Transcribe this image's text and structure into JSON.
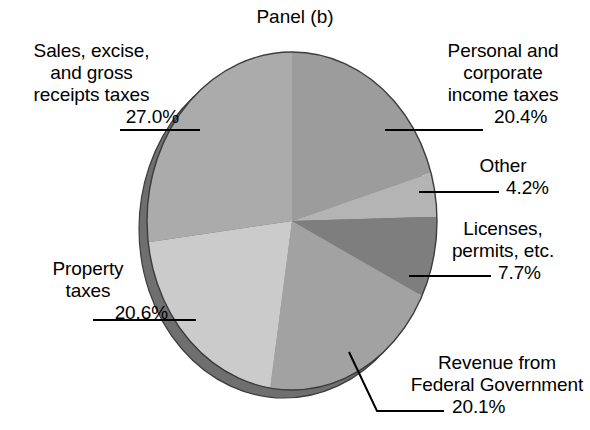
{
  "title": "Panel (b)",
  "chart_data": {
    "type": "pie",
    "title": "Panel (b)",
    "xlabel": "",
    "ylabel": "",
    "grid": false,
    "legend": "none",
    "labels_position": "outside-with-leader-lines",
    "style": "3d-ellipse",
    "total": "100.0%",
    "slices": [
      {
        "name": "personal-and-corporate-income-taxes",
        "label_lines": [
          "Personal and",
          "corporate",
          "income taxes"
        ],
        "value_text": "20.4%",
        "value": 20.4,
        "color": "#9c9c9c",
        "start_angle_deg": 0,
        "end_angle_deg": 73.44
      },
      {
        "name": "other",
        "label_lines": [
          "Other"
        ],
        "value_text": "4.2%",
        "value": 4.2,
        "color": "#b4b4b4",
        "start_angle_deg": 73.44,
        "end_angle_deg": 88.56
      },
      {
        "name": "licenses-permits-etc",
        "label_lines": [
          "Licenses,",
          "permits, etc."
        ],
        "value_text": "7.7%",
        "value": 7.7,
        "color": "#7e7e7e",
        "start_angle_deg": 88.56,
        "end_angle_deg": 116.28
      },
      {
        "name": "revenue-from-federal-government",
        "label_lines": [
          "Revenue from",
          "Federal Government"
        ],
        "value_text": "20.1%",
        "value": 20.1,
        "color": "#a2a2a2",
        "start_angle_deg": 116.28,
        "end_angle_deg": 188.64
      },
      {
        "name": "property-taxes",
        "label_lines": [
          "Property",
          "taxes"
        ],
        "value_text": "20.6%",
        "value": 20.6,
        "color": "#cbcbcb",
        "start_angle_deg": 188.64,
        "end_angle_deg": 262.8
      },
      {
        "name": "sales-excise-and-gross-receipts-taxes",
        "label_lines": [
          "Sales, excise,",
          "and gross",
          "receipts taxes"
        ],
        "value_text": "27.0%",
        "value": 27.0,
        "color": "#ababab",
        "start_angle_deg": 262.8,
        "end_angle_deg": 360
      }
    ],
    "categories": [
      "Personal and corporate income taxes",
      "Other",
      "Licenses, permits, etc.",
      "Revenue from Federal Government",
      "Property taxes",
      "Sales, excise, and gross receipts taxes"
    ],
    "values": [
      20.4,
      4.2,
      7.7,
      20.1,
      20.6,
      27.0
    ],
    "colors": {
      "side_3d": "#6f6f6f",
      "outline": "#3c3c3c",
      "leader_line": "#000000",
      "background": "#ffffff",
      "text": "#000000"
    }
  }
}
